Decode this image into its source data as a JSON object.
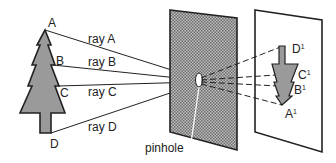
{
  "diagram": {
    "object_points": [
      "A",
      "B",
      "C",
      "D"
    ],
    "rays": [
      "ray A",
      "ray B",
      "ray C",
      "ray D"
    ],
    "pinhole_label": "pinhole",
    "image_points": [
      {
        "letter": "D",
        "sup": "1"
      },
      {
        "letter": "C",
        "sup": "1"
      },
      {
        "letter": "B",
        "sup": "1"
      },
      {
        "letter": "A",
        "sup": "1"
      }
    ],
    "colors": {
      "tree_fill": "#9a9a9a",
      "screen_fill": "#8c8c8c",
      "line": "#222222"
    }
  }
}
